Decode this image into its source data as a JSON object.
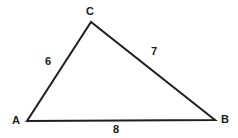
{
  "figure": {
    "type": "geometry-diagram",
    "shape": "triangle",
    "background_color": "#ffffff",
    "stroke_color": "#1f1f1f",
    "text_color": "#1a1a1a",
    "canvas": {
      "width": 238,
      "height": 138
    },
    "vertices": [
      {
        "name": "C",
        "label": "C",
        "x": 91,
        "y": 22
      },
      {
        "name": "A",
        "label": "A",
        "x": 27,
        "y": 121
      },
      {
        "name": "B",
        "label": "B",
        "x": 215,
        "y": 120
      }
    ],
    "sides": [
      {
        "name": "AC",
        "label": "6",
        "value": 6,
        "from": "A",
        "to": "C"
      },
      {
        "name": "CB",
        "label": "7",
        "value": 7,
        "from": "C",
        "to": "B"
      },
      {
        "name": "AB",
        "label": "8",
        "value": 8,
        "from": "A",
        "to": "B"
      }
    ]
  },
  "chart_data": {
    "type": "diagram",
    "title": "",
    "categories": [
      "AC",
      "CB",
      "AB"
    ],
    "values": [
      6,
      7,
      8
    ],
    "labels": [
      "6",
      "7",
      "8"
    ],
    "vertex_labels": [
      "A",
      "B",
      "C"
    ],
    "xlabel": "",
    "ylabel": ""
  }
}
